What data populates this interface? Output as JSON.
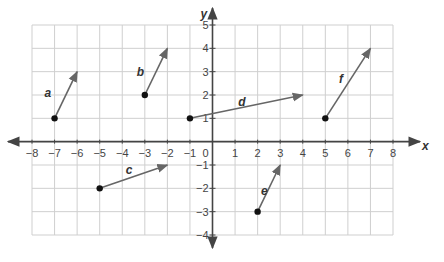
{
  "chart_data": {
    "type": "vector-plot",
    "title": "",
    "xlabel": "x",
    "ylabel": "y",
    "xlim": [
      -8,
      8
    ],
    "ylim": [
      -4,
      5
    ],
    "grid": true,
    "x_ticks": [
      -8,
      -7,
      -6,
      -5,
      -4,
      -3,
      -2,
      -1,
      0,
      1,
      2,
      3,
      4,
      5,
      6,
      7,
      8
    ],
    "y_ticks": [
      5,
      4,
      3,
      2,
      1,
      -1,
      -2,
      -3,
      -4
    ],
    "vectors": [
      {
        "label": "a",
        "start": [
          -7,
          1
        ],
        "end": [
          -6,
          3
        ],
        "label_pos": [
          -7.3,
          2.1
        ]
      },
      {
        "label": "b",
        "start": [
          -3,
          2
        ],
        "end": [
          -2,
          4
        ],
        "label_pos": [
          -3.2,
          3.0
        ]
      },
      {
        "label": "c",
        "start": [
          -5,
          -2
        ],
        "end": [
          -2,
          -1
        ],
        "label_pos": [
          -3.7,
          -1.2
        ]
      },
      {
        "label": "d",
        "start": [
          -1,
          1
        ],
        "end": [
          4,
          2
        ],
        "label_pos": [
          1.3,
          1.7
        ]
      },
      {
        "label": "e",
        "start": [
          2,
          -3
        ],
        "end": [
          3,
          -1
        ],
        "label_pos": [
          2.3,
          -2.1
        ]
      },
      {
        "label": "f",
        "start": [
          5,
          1
        ],
        "end": [
          7,
          4
        ],
        "label_pos": [
          5.7,
          2.7
        ]
      }
    ]
  },
  "colors": {
    "grid": "#cfcfcf",
    "axis": "#444444",
    "vector": "#666666",
    "point": "#111111",
    "text": "#333333"
  }
}
